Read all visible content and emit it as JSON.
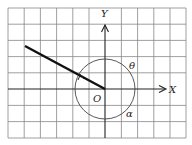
{
  "diagram": {
    "type": "coordinate-angle-diagram",
    "labels": {
      "x_axis": "X",
      "y_axis": "Y",
      "origin": "O",
      "angle_theta": "θ",
      "angle_alpha": "α"
    },
    "grid": {
      "columns": 11,
      "rows": 8,
      "line_color": "#777777"
    },
    "ray": {
      "from": "origin",
      "direction": "upper-left",
      "color": "#111111"
    },
    "colors": {
      "axis": "#222222",
      "circle": "#444444"
    }
  }
}
